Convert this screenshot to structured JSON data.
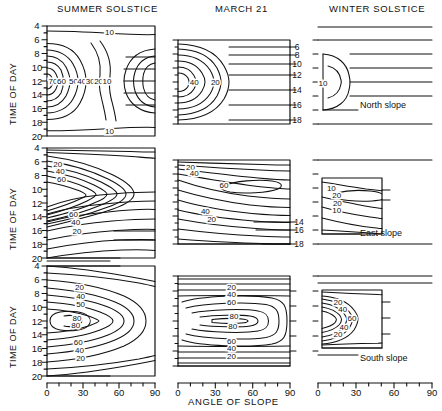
{
  "figure": {
    "column_titles": [
      "SUMMER SOLSTICE",
      "MARCH 21",
      "WINTER SOLSTICE"
    ],
    "y_axis_title": "TIME OF DAY",
    "x_axis_title": "ANGLE OF SLOPE",
    "row_labels": [
      "North slope",
      "East slope",
      "South slope"
    ],
    "y_ticks": [
      "4",
      "6",
      "8",
      "10",
      "12",
      "14",
      "16",
      "18",
      "20"
    ],
    "x_ticks": [
      "0",
      "30",
      "60",
      "90"
    ],
    "line_color": "#111111",
    "background": "#ffffff"
  },
  "chart_data": [
    {
      "type": "contour",
      "title": "SUMMER SOLSTICE",
      "row": "North slope",
      "xlabel": "ANGLE OF SLOPE",
      "ylabel": "TIME OF DAY",
      "xlim": [
        0,
        90
      ],
      "ylim": [
        4,
        20
      ],
      "grid": false,
      "contour_levels": [
        10,
        20,
        30,
        40,
        50,
        60,
        70
      ],
      "labels": [
        {
          "text": "10",
          "x": 52,
          "y": 4.8
        },
        {
          "text": "70",
          "x": 5,
          "y": 12
        },
        {
          "text": "60",
          "x": 12,
          "y": 12
        },
        {
          "text": "50",
          "x": 22,
          "y": 12
        },
        {
          "text": "40",
          "x": 29,
          "y": 12
        },
        {
          "text": "30",
          "x": 36,
          "y": 12
        },
        {
          "text": "20",
          "x": 43,
          "y": 12
        },
        {
          "text": "10",
          "x": 50,
          "y": 12
        },
        {
          "text": "10",
          "x": 52,
          "y": 19.2
        }
      ],
      "notes": "Maximum >70 at zero slope near midday; values fall to <10 beyond ~55 deg slope; daylight 4-20 h"
    },
    {
      "type": "contour",
      "title": "MARCH 21",
      "row": "North slope",
      "xlabel": "ANGLE OF SLOPE",
      "ylabel": "TIME OF DAY",
      "xlim": [
        0,
        90
      ],
      "ylim": [
        6,
        18
      ],
      "grid": false,
      "contour_levels": [
        10,
        20,
        30,
        40,
        50
      ],
      "labels": [
        {
          "text": "40",
          "x": 13,
          "y": 12
        },
        {
          "text": "20",
          "x": 30,
          "y": 12
        }
      ],
      "notes": "Daylight 6-18 h; nested arcs opening right, maximum at zero slope at noon"
    },
    {
      "type": "contour",
      "title": "WINTER SOLSTICE",
      "row": "North slope",
      "xlabel": "ANGLE OF SLOPE",
      "ylabel": "TIME OF DAY",
      "xlim": [
        0,
        90
      ],
      "ylim": [
        8,
        16
      ],
      "grid": false,
      "contour_levels": [
        10
      ],
      "labels": [
        {
          "text": "10",
          "x": 7,
          "y": 12.2
        }
      ],
      "notes": "Only a small D-shaped region above 10 near zero slope around noon; daylight 8-16 h"
    },
    {
      "type": "contour",
      "title": "SUMMER SOLSTICE",
      "row": "East slope",
      "xlabel": "ANGLE OF SLOPE",
      "ylabel": "TIME OF DAY",
      "xlim": [
        0,
        90
      ],
      "ylim": [
        4,
        20
      ],
      "grid": false,
      "contour_levels": [
        20,
        40,
        60
      ],
      "labels": [
        {
          "text": "20",
          "x": 9,
          "y": 6.3
        },
        {
          "text": "40",
          "x": 11,
          "y": 7.4
        },
        {
          "text": "60",
          "x": 12,
          "y": 8.5
        },
        {
          "text": "60",
          "x": 22,
          "y": 13.6
        },
        {
          "text": "40",
          "x": 24,
          "y": 14.8
        },
        {
          "text": "20",
          "x": 25,
          "y": 16.0
        }
      ],
      "notes": "Lobes open to the right, peak near 9-10 h in morning; radiation tails off late in day"
    },
    {
      "type": "contour",
      "title": "MARCH 21",
      "row": "East slope",
      "xlabel": "ANGLE OF SLOPE",
      "ylabel": "TIME OF DAY",
      "xlim": [
        0,
        90
      ],
      "ylim": [
        6,
        18
      ],
      "grid": false,
      "contour_levels": [
        20,
        40,
        60
      ],
      "labels": [
        {
          "text": "20",
          "x": 10,
          "y": 7.0
        },
        {
          "text": "40",
          "x": 13,
          "y": 7.9
        },
        {
          "text": "60",
          "x": 37,
          "y": 9.5
        },
        {
          "text": "40",
          "x": 22,
          "y": 13.3
        },
        {
          "text": "20",
          "x": 27,
          "y": 14.4
        }
      ],
      "notes": "Closed 60 oval centred near 55 deg at 9 h; daylight 6-18 h"
    },
    {
      "type": "contour",
      "title": "WINTER SOLSTICE",
      "row": "East slope",
      "xlabel": "ANGLE OF SLOPE",
      "ylabel": "TIME OF DAY",
      "xlim": [
        0,
        90
      ],
      "ylim": [
        8,
        16
      ],
      "grid": false,
      "contour_levels": [
        10,
        20
      ],
      "labels": [
        {
          "text": "10",
          "x": 14,
          "y": 9.4
        },
        {
          "text": "20",
          "x": 22,
          "y": 10.4
        },
        {
          "text": "20",
          "x": 23,
          "y": 11.6
        },
        {
          "text": "10",
          "x": 22,
          "y": 12.6
        }
      ],
      "notes": "Weak band of 10-20 between 9 and 13 h; daylight 8-16 h"
    },
    {
      "type": "contour",
      "title": "SUMMER SOLSTICE",
      "row": "South slope",
      "xlabel": "ANGLE OF SLOPE",
      "ylabel": "TIME OF DAY",
      "xlim": [
        0,
        90
      ],
      "ylim": [
        4,
        20
      ],
      "grid": false,
      "contour_levels": [
        20,
        40,
        50,
        60,
        80
      ],
      "labels": [
        {
          "text": "20",
          "x": 27,
          "y": 7.0
        },
        {
          "text": "40",
          "x": 28,
          "y": 8.3
        },
        {
          "text": "50",
          "x": 28,
          "y": 9.5
        },
        {
          "text": "80",
          "x": 25,
          "y": 11.5
        },
        {
          "text": "80",
          "x": 24,
          "y": 12.6
        },
        {
          "text": "60",
          "x": 26,
          "y": 15.0
        },
        {
          "text": "40",
          "x": 27,
          "y": 16.2
        },
        {
          "text": "20",
          "x": 28,
          "y": 17.4
        }
      ],
      "notes": "Closed maxima >80 centred near 20-25 deg slope at solar noon"
    },
    {
      "type": "contour",
      "title": "MARCH 21",
      "row": "South slope",
      "xlabel": "ANGLE OF SLOPE",
      "ylabel": "TIME OF DAY",
      "xlim": [
        0,
        90
      ],
      "ylim": [
        6,
        18
      ],
      "grid": false,
      "contour_levels": [
        20,
        40,
        60,
        80
      ],
      "labels": [
        {
          "text": "20",
          "x": 43,
          "y": 7.4
        },
        {
          "text": "40",
          "x": 43,
          "y": 8.4
        },
        {
          "text": "60",
          "x": 43,
          "y": 9.4
        },
        {
          "text": "80",
          "x": 45,
          "y": 11.3
        },
        {
          "text": "80",
          "x": 44,
          "y": 12.7
        },
        {
          "text": "60",
          "x": 43,
          "y": 14.6
        },
        {
          "text": "40",
          "x": 43,
          "y": 15.6
        },
        {
          "text": "20",
          "x": 43,
          "y": 16.6
        }
      ],
      "notes": "Concentric ovals centred near 45 deg slope at noon, maximum above 80"
    },
    {
      "type": "contour",
      "title": "WINTER SOLSTICE",
      "row": "South slope",
      "xlabel": "ANGLE OF SLOPE",
      "ylabel": "TIME OF DAY",
      "xlim": [
        0,
        90
      ],
      "ylim": [
        8,
        16
      ],
      "grid": false,
      "contour_levels": [
        20,
        40,
        60
      ],
      "labels": [
        {
          "text": "20",
          "x": 24,
          "y": 9.7
        },
        {
          "text": "40",
          "x": 31,
          "y": 10.6
        },
        {
          "text": "60",
          "x": 45,
          "y": 11.8
        },
        {
          "text": "40",
          "x": 33,
          "y": 13.1
        },
        {
          "text": "20",
          "x": 24,
          "y": 14.1
        }
      ],
      "notes": "Arcs opening right with >60 at high slope angles near noon; daylight 8-16 h"
    }
  ]
}
